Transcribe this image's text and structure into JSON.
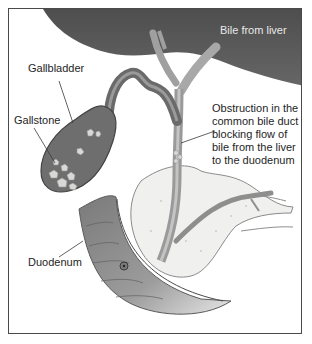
{
  "figure": {
    "labels": {
      "bile_from_liver": "Bile from liver",
      "gallbladder": "Gallbladder",
      "gallstone": "Gallstone",
      "obstruction": "Obstruction in the\ncommon bile duct\nblocking flow of\nbile from the liver\nto the duodenum",
      "duodenum": "Duodenum"
    },
    "colors": {
      "liver": "#5a5a5a",
      "gallbladder": "#6e6e6e",
      "duct": "#9a9a9a",
      "pancreas": "#f0f0ee",
      "duodenum": "#8c8c8c",
      "stone": "#d8d8d6",
      "border": "#4a4a4a"
    }
  }
}
